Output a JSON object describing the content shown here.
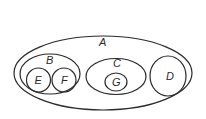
{
  "diagram": {
    "type": "venn-nested-sets",
    "sets": [
      {
        "id": "A",
        "label": "A",
        "contains": [
          "B",
          "C",
          "D"
        ]
      },
      {
        "id": "B",
        "label": "B",
        "contains": [
          "E",
          "F"
        ]
      },
      {
        "id": "C",
        "label": "C",
        "contains": [
          "G"
        ]
      },
      {
        "id": "D",
        "label": "D",
        "contains": []
      },
      {
        "id": "E",
        "label": "E",
        "contains": []
      },
      {
        "id": "F",
        "label": "F",
        "contains": []
      },
      {
        "id": "G",
        "label": "G",
        "contains": []
      }
    ],
    "labels": {
      "A": "A",
      "B": "B",
      "C": "C",
      "D": "D",
      "E": "E",
      "F": "F",
      "G": "G"
    },
    "stroke_color": "#2a2a2a",
    "background": "#ffffff"
  }
}
